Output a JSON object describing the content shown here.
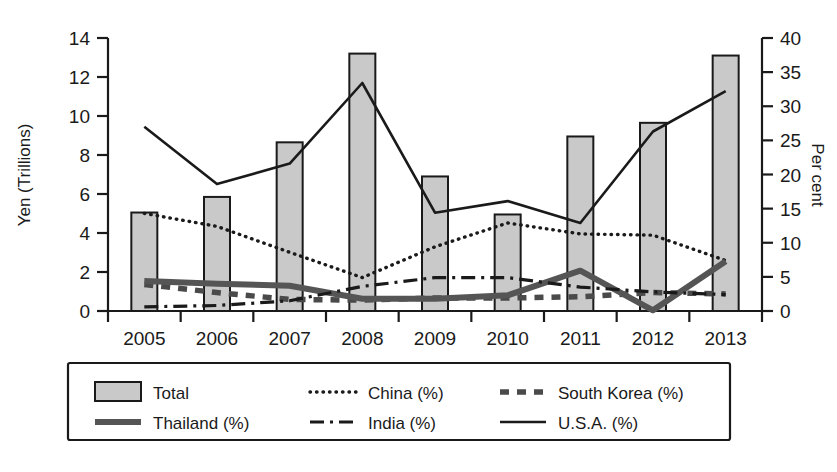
{
  "chart_data": {
    "type": "bar",
    "title": "",
    "subtitle": "",
    "categories": [
      "2005",
      "2006",
      "2007",
      "2008",
      "2009",
      "2010",
      "2011",
      "2012",
      "2013"
    ],
    "xlabel": "",
    "ylabel": "Yen (Trillions)",
    "y2label": "Per cent",
    "ylim": [
      0,
      14
    ],
    "y2lim": [
      0,
      40
    ],
    "yticks": [
      0,
      2,
      4,
      6,
      8,
      10,
      12,
      14
    ],
    "y2ticks": [
      0,
      5,
      10,
      15,
      20,
      25,
      30,
      35,
      40
    ],
    "grid": false,
    "legend_position": "bottom",
    "series": [
      {
        "name": "Total",
        "key": "total",
        "axis": "left",
        "unit": "Yen (Trillions)",
        "style": "bar",
        "values": [
          5.05,
          5.85,
          8.65,
          13.2,
          6.9,
          4.95,
          8.95,
          9.65,
          13.1
        ]
      },
      {
        "name": "China (%)",
        "key": "china",
        "axis": "right",
        "unit": "Per cent",
        "style": "dotted",
        "values": [
          14.3,
          12.4,
          8.6,
          4.9,
          9.4,
          12.9,
          11.3,
          11.1,
          7.4
        ]
      },
      {
        "name": "South Korea (%)",
        "key": "south_korea",
        "axis": "right",
        "unit": "Per cent",
        "style": "dashed",
        "values": [
          3.9,
          2.7,
          1.7,
          1.6,
          1.9,
          1.9,
          2.1,
          2.7,
          2.5
        ]
      },
      {
        "name": "Thailand (%)",
        "key": "thailand",
        "axis": "right",
        "unit": "Per cent",
        "style": "thick-solid",
        "values": [
          4.4,
          4.0,
          3.7,
          1.8,
          1.8,
          2.3,
          5.9,
          0.1,
          7.3
        ]
      },
      {
        "name": "India (%)",
        "key": "india",
        "axis": "right",
        "unit": "Per cent",
        "style": "dash-dot",
        "values": [
          0.6,
          0.8,
          1.5,
          3.6,
          4.9,
          4.9,
          3.5,
          2.8,
          2.4
        ]
      },
      {
        "name": "U.S.A. (%)",
        "key": "usa",
        "axis": "right",
        "unit": "Per cent",
        "style": "solid",
        "values": [
          27.0,
          18.6,
          21.6,
          33.4,
          14.4,
          16.1,
          12.9,
          26.3,
          32.2
        ]
      }
    ]
  },
  "axes": {
    "left": {
      "label": "Yen (Trillions)",
      "ticks": [
        "0",
        "2",
        "4",
        "6",
        "8",
        "10",
        "12",
        "14"
      ]
    },
    "right": {
      "label": "Per cent",
      "ticks": [
        "0",
        "5",
        "10",
        "15",
        "20",
        "25",
        "30",
        "35",
        "40"
      ]
    },
    "bottom": {
      "ticks": [
        "2005",
        "2006",
        "2007",
        "2008",
        "2009",
        "2010",
        "2011",
        "2012",
        "2013"
      ]
    }
  },
  "legend": {
    "entries": [
      {
        "label": "Total",
        "marker": "filled-rect-swatch"
      },
      {
        "label": "China (%)",
        "marker": "dotted-line-swatch"
      },
      {
        "label": "South Korea (%)",
        "marker": "dashed-line-swatch"
      },
      {
        "label": "Thailand (%)",
        "marker": "thick-solid-line-swatch"
      },
      {
        "label": "India (%)",
        "marker": "dash-dot-line-swatch"
      },
      {
        "label": "U.S.A. (%)",
        "marker": "solid-line-swatch"
      }
    ]
  },
  "colors": {
    "bar_fill": "#c9c9c9",
    "ink": "#1a1a1a",
    "thailand_line": "#555555",
    "background": "#ffffff"
  }
}
